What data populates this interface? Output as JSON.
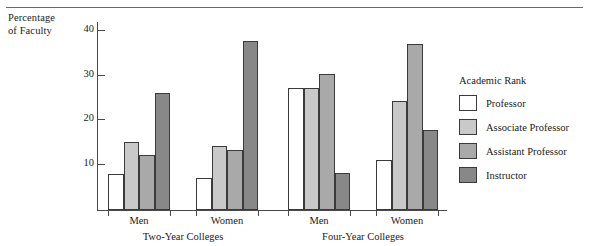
{
  "chart_data": {
    "type": "bar",
    "title": "",
    "xlabel": "",
    "ylabel": "Percentage of Faculty",
    "ylabel_lines": [
      "Percentage",
      "of Faculty"
    ],
    "ylim": [
      0,
      42
    ],
    "yticks": [
      10,
      20,
      30,
      40
    ],
    "ytick_labels": [
      "10",
      "20",
      "30",
      "40"
    ],
    "grid": false,
    "legend_position": "right",
    "legend_title": "Academic Rank",
    "categories": [
      "Men",
      "Women",
      "Men",
      "Women"
    ],
    "sections": [
      {
        "label": "Two-Year Colleges",
        "groups": [
          "Men",
          "Women"
        ]
      },
      {
        "label": "Four-Year Colleges",
        "groups": [
          "Men",
          "Women"
        ]
      }
    ],
    "series": [
      {
        "name": "Professor",
        "color": "#ffffff",
        "values": [
          8.0,
          7.2,
          27.3,
          11.2
        ]
      },
      {
        "name": "Associate Professor",
        "color": "#c9c9c9",
        "values": [
          15.3,
          14.2,
          27.3,
          24.3
        ]
      },
      {
        "name": "Assistant Professor",
        "color": "#a9a9a9",
        "values": [
          12.3,
          13.4,
          30.4,
          37.1
        ]
      },
      {
        "name": "Instructor",
        "color": "#888888",
        "values": [
          26.2,
          37.7,
          8.3,
          17.9
        ]
      }
    ]
  },
  "legend": {
    "title": "Academic Rank",
    "items": [
      {
        "label": "Professor",
        "color": "#ffffff"
      },
      {
        "label": "Associate Professor",
        "color": "#c9c9c9"
      },
      {
        "label": "Assistant Professor",
        "color": "#a9a9a9"
      },
      {
        "label": "Instructor",
        "color": "#888888"
      }
    ]
  },
  "axis": {
    "y_title_line1": "Percentage",
    "y_title_line2": "of Faculty",
    "y_ticks": [
      "40",
      "30",
      "20",
      "10"
    ]
  },
  "x_labels": {
    "group_1": "Men",
    "group_2": "Women",
    "group_3": "Men",
    "group_4": "Women",
    "section_1": "Two-Year Colleges",
    "section_2": "Four-Year Colleges"
  }
}
